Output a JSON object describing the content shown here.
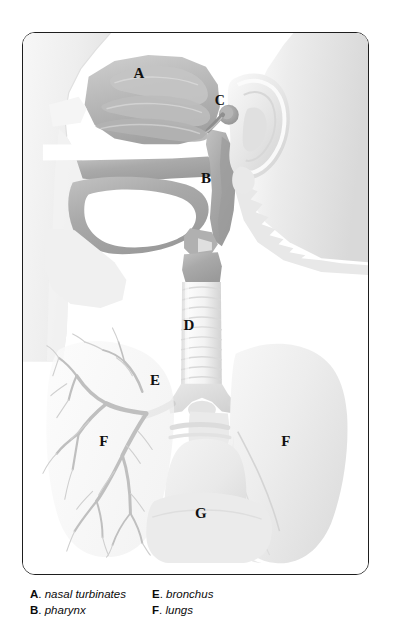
{
  "figure": {
    "frame_color": "#1e1e1e",
    "background_color": "#ffffff",
    "callouts": [
      {
        "key": "A",
        "structure": "nasal turbinates",
        "x": 138,
        "y": 72
      },
      {
        "key": "B",
        "structure": "pharynx",
        "x": 205,
        "y": 177
      },
      {
        "key": "C",
        "structure": "eustachian tube",
        "x": 219,
        "y": 100
      },
      {
        "key": "D",
        "structure": "trachea",
        "x": 188,
        "y": 324
      },
      {
        "key": "E",
        "structure": "bronchus",
        "x": 154,
        "y": 379
      },
      {
        "key": "F",
        "structure": "lungs",
        "x": 103,
        "y": 440
      },
      {
        "key": "F2",
        "label": "F",
        "structure": "lungs",
        "x": 285,
        "y": 440
      },
      {
        "key": "G",
        "structure": "diaphragm",
        "x": 200,
        "y": 512
      }
    ]
  },
  "legend": {
    "left_column": [
      {
        "key": "A",
        "dot": ".",
        "term": "nasal turbinates"
      },
      {
        "key": "B",
        "dot": ".",
        "term": "pharynx"
      }
    ],
    "right_column": [
      {
        "key": "E",
        "dot": ".",
        "term": "bronchus"
      },
      {
        "key": "F",
        "dot": ".",
        "term": "lungs"
      }
    ]
  },
  "colors": {
    "ink": "#111111",
    "frame": "#1e1e1e",
    "tissue_mid": "#a8a8a8",
    "tissue_light": "#d8d8d8",
    "lung_fill": "#efefef",
    "airway_fill": "#f4f4f4"
  }
}
